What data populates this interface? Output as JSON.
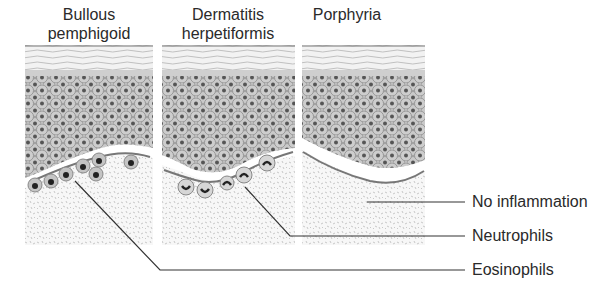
{
  "panels": [
    {
      "title_line1": "Bullous",
      "title_line2": "pemphigoid"
    },
    {
      "title_line1": "Dermatitis",
      "title_line2": "herpetiformis"
    },
    {
      "title_line1": "Porphyria",
      "title_line2": ""
    }
  ],
  "labels": {
    "no_inflammation": "No inflammation",
    "neutrophils": "Neutrophils",
    "eosinophils": "Eosinophils"
  },
  "colors": {
    "cell_fill": "#c9c9c9",
    "nucleus": "#555555",
    "dermis_speckle": "#d4d4d4",
    "line": "#333333"
  }
}
